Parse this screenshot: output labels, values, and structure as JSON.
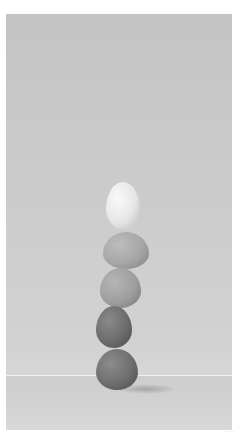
{
  "image": {
    "subject": "Five eggs balanced in a vertical stack against a light gray backdrop",
    "background_color": "#c9c9c9",
    "horizon_line_color": "#f2f2f2",
    "eggs": [
      {
        "position": "top",
        "tone": "white",
        "color": "#ececec"
      },
      {
        "position": "second",
        "tone": "light",
        "color": "#a9a9a9"
      },
      {
        "position": "middle",
        "tone": "light-medium",
        "color": "#a2a2a2"
      },
      {
        "position": "fourth",
        "tone": "dark",
        "color": "#6e6e6e"
      },
      {
        "position": "bottom",
        "tone": "dark",
        "color": "#707070"
      }
    ]
  },
  "caption": {
    "text": "·····  ···"
  }
}
